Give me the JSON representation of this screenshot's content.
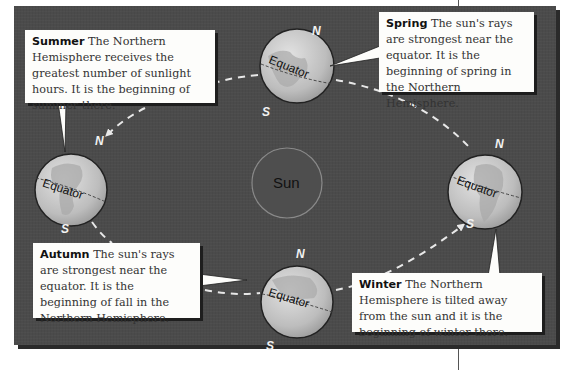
{
  "diagram": {
    "type": "earth-orbit-seasons",
    "sun_label": "Sun",
    "pole_labels": {
      "north": "N",
      "south": "S"
    },
    "equator_label": "Equator",
    "colors": {
      "background": "#4b4b4b",
      "callout": "#fdfdfb",
      "orbit_dash": "#e8e8e8",
      "globe": "#c9c9c9",
      "sun_outline": "#8a8a8a"
    },
    "callouts": [
      {
        "id": "summer",
        "season": "Summer",
        "text": "The Northern Hemisphere receives the greatest number of sunlight hours. It is the beginning of summer there."
      },
      {
        "id": "spring",
        "season": "Spring",
        "text": "The sun's rays are strongest near the equator. It is the beginning of spring in the Northern Hemisphere."
      },
      {
        "id": "autumn",
        "season": "Autumn",
        "text": "The sun's rays are strongest near the equator. It is the beginning of fall in the Northern Hemisphere."
      },
      {
        "id": "winter",
        "season": "Winter",
        "text": "The Northern Hemisphere is tilted away from the sun and it is the beginning of winter there."
      }
    ],
    "globes": [
      {
        "id": "globe-spring",
        "position": "top"
      },
      {
        "id": "globe-summer",
        "position": "left"
      },
      {
        "id": "globe-winter",
        "position": "right"
      },
      {
        "id": "globe-autumn",
        "position": "bottom"
      }
    ]
  }
}
